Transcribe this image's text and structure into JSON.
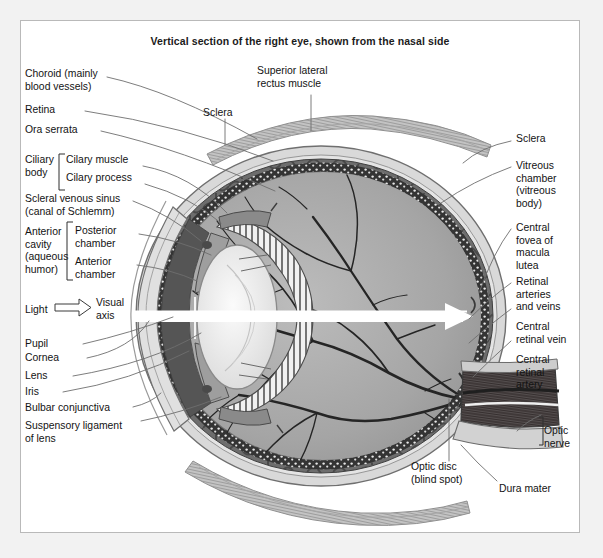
{
  "figure": {
    "title": "Vertical section of the right eye, shown from the nasal side",
    "background_color": "#f2f2f2",
    "panel_color": "#ffffff",
    "border_color": "#b9b9b9"
  },
  "labels_left": [
    {
      "id": "choroid",
      "text": "Choroid (mainly\nblood vessels)"
    },
    {
      "id": "retina",
      "text": "Retina"
    },
    {
      "id": "ora-serrata",
      "text": "Ora serrata"
    },
    {
      "id": "ciliary-body",
      "text": "Ciliary\nbody"
    },
    {
      "id": "ciliary-muscle",
      "text": "Cilary muscle"
    },
    {
      "id": "ciliary-process",
      "text": "Cilary process"
    },
    {
      "id": "scleral-venous-sinus",
      "text": "Scleral venous sinus\n(canal of Schlemm)"
    },
    {
      "id": "anterior-cavity",
      "text": "Anterior\ncavity\n(aqueous\nhumor)"
    },
    {
      "id": "posterior-chamber",
      "text": "Posterior\nchamber"
    },
    {
      "id": "anterior-chamber",
      "text": "Anterior\nchamber"
    },
    {
      "id": "light",
      "text": "Light"
    },
    {
      "id": "visual-axis",
      "text": "Visual\naxis"
    },
    {
      "id": "pupil",
      "text": "Pupil"
    },
    {
      "id": "cornea",
      "text": "Cornea"
    },
    {
      "id": "lens",
      "text": "Lens"
    },
    {
      "id": "iris",
      "text": "Iris"
    },
    {
      "id": "bulbar-conjunctiva",
      "text": "Bulbar conjunctiva"
    },
    {
      "id": "suspensory-ligament",
      "text": "Suspensory ligament\nof lens"
    }
  ],
  "labels_top": [
    {
      "id": "sclera-top",
      "text": "Sclera"
    },
    {
      "id": "superior-rectus",
      "text": "Superior lateral\nrectus muscle"
    }
  ],
  "labels_right": [
    {
      "id": "sclera-right",
      "text": "Sclera"
    },
    {
      "id": "vitreous-chamber",
      "text": "Vitreous\nchamber\n(vitreous\nbody)"
    },
    {
      "id": "central-fovea",
      "text": "Central\nfovea of\nmacula\nlutea"
    },
    {
      "id": "retinal-arteries-veins",
      "text": "Retinal\narteries\nand veins"
    },
    {
      "id": "central-retinal-vein",
      "text": "Central\nretinal vein"
    },
    {
      "id": "central-retinal-artery",
      "text": "Central\nretinal\nartery"
    },
    {
      "id": "optic-nerve",
      "text": "Optic\nnerve"
    }
  ],
  "labels_bottom": [
    {
      "id": "optic-disc",
      "text": "Optic disc\n(blind spot)"
    },
    {
      "id": "dura-mater",
      "text": "Dura mater"
    }
  ],
  "colors": {
    "sclera": "#d9d9d9",
    "choroid": "#6d6d6d",
    "retina_pigment": "#3c3c3c",
    "vitreous": "#a8a8a8",
    "lens": "#ededed",
    "muscle": "#bdbdbd",
    "optic_nerve": "#595959",
    "vessel": "#2b2b2b",
    "leader": "#6e6e6e",
    "text": "#131313"
  }
}
